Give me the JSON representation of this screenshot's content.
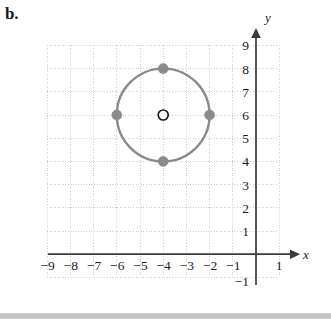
{
  "figure": {
    "part_label": "b.",
    "axis_labels": {
      "x": "x",
      "y": "y"
    },
    "colors": {
      "axis": "#3a3a3a",
      "grid": "#cfcfcf",
      "curve": "#8a8a8a",
      "point_fill": "#8a8a8a",
      "center_stroke": "#1a1a1a",
      "text": "#1a1a1a",
      "background": "#ffffff",
      "bottom_band": "#bdbdbd"
    }
  },
  "chart_data": {
    "type": "scatter",
    "title": "",
    "xlabel": "x",
    "ylabel": "y",
    "grid": true,
    "legend": null,
    "xlim": [
      -9.5,
      1.5
    ],
    "ylim": [
      -1.5,
      9.5
    ],
    "x_ticks": [
      -9,
      -8,
      -7,
      -6,
      -5,
      -4,
      -3,
      -2,
      -1,
      1
    ],
    "y_ticks": [
      9,
      8,
      7,
      6,
      5,
      4,
      3,
      2,
      1,
      -1
    ],
    "x_tick_labels": [
      "−9",
      "−8",
      "−7",
      "−6",
      "−5",
      "−4",
      "−3",
      "−2",
      "−1",
      "1"
    ],
    "y_tick_labels": [
      "9",
      "8",
      "7",
      "6",
      "5",
      "4",
      "3",
      "2",
      "1",
      "−1"
    ],
    "shapes": [
      {
        "kind": "circle",
        "center": [
          -4,
          6
        ],
        "radius": 2,
        "stroke": "#8a8a8a",
        "fill": "none",
        "label": "circle centered at (-4, 6) with radius 2"
      }
    ],
    "series": [
      {
        "name": "plotted points on circle",
        "marker": "filled-circle",
        "points": [
          {
            "x": -4,
            "y": 8,
            "label": "top point"
          },
          {
            "x": -2,
            "y": 6,
            "label": "right point"
          },
          {
            "x": -4,
            "y": 4,
            "label": "bottom point"
          },
          {
            "x": -6,
            "y": 6,
            "label": "left point"
          }
        ]
      },
      {
        "name": "center point",
        "marker": "open-circle",
        "points": [
          {
            "x": -4,
            "y": 6,
            "label": "center"
          }
        ]
      }
    ]
  }
}
